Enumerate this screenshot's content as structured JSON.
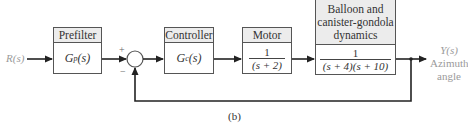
{
  "diagram": {
    "type": "block-diagram",
    "input_label": "R(s)",
    "output": {
      "symbol": "Y(s)",
      "line1": "Azimuth",
      "line2": "angle"
    },
    "summing_junction": {
      "plus_sign": "+",
      "minus_sign": "−"
    },
    "blocks": [
      {
        "title": "Prefilter",
        "tf": "Gp(s)",
        "tf_main": "G",
        "tf_sub": "p",
        "tf_arg": "(s)"
      },
      {
        "title": "Controller",
        "tf": "Gc(s)",
        "tf_main": "G",
        "tf_sub": "c",
        "tf_arg": "(s)"
      },
      {
        "title": "Motor",
        "tf_num": "1",
        "tf_den": "(s + 2)"
      },
      {
        "title_line1": "Balloon and",
        "title_line2": "canister-gondola",
        "title_line3": "dynamics",
        "tf_num": "1",
        "tf_den": "(s + 4)(s + 10)"
      }
    ],
    "feedback": "unity negative feedback from Y(s) to summing junction",
    "caption": "(b)",
    "colors": {
      "line": "#222222",
      "block_border": "#555555",
      "header_fill": "#ececec",
      "label_gray": "#9a9a9a"
    }
  }
}
